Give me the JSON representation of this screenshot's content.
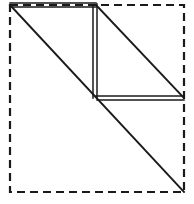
{
  "figure": {
    "canvas": {
      "width": 194,
      "height": 204
    },
    "background_color": "#ffffff",
    "line_color": "#1a1a1a",
    "boundary": {
      "name": "dashed-square-boundary",
      "style": "dashed",
      "x1": 10,
      "y1": 5,
      "x2": 184,
      "y2": 192,
      "dash_length": 8,
      "gap_length": 5,
      "stroke_width": 2.2
    },
    "lines": [
      {
        "name": "main-diagonal",
        "style": "solid",
        "stroke_width": 1.9,
        "points": [
          [
            10,
            5
          ],
          [
            184,
            192
          ]
        ]
      },
      {
        "name": "top-edge-outer",
        "style": "solid",
        "stroke_width": 1.5,
        "points": [
          [
            10,
            3
          ],
          [
            96,
            3
          ]
        ]
      },
      {
        "name": "top-edge-inner",
        "style": "solid",
        "stroke_width": 1.5,
        "points": [
          [
            11,
            7
          ],
          [
            96,
            7
          ]
        ]
      },
      {
        "name": "vertical-edge-left",
        "style": "solid",
        "stroke_width": 1.5,
        "points": [
          [
            93,
            6
          ],
          [
            93,
            98
          ]
        ]
      },
      {
        "name": "vertical-edge-right",
        "style": "solid",
        "stroke_width": 1.5,
        "points": [
          [
            97,
            4
          ],
          [
            97,
            98
          ]
        ]
      },
      {
        "name": "upper-right-diagonal",
        "style": "solid",
        "stroke_width": 1.9,
        "points": [
          [
            96,
            5
          ],
          [
            183,
            97
          ]
        ]
      },
      {
        "name": "horizontal-mid-edge-upper",
        "style": "solid",
        "stroke_width": 1.5,
        "points": [
          [
            96,
            96
          ],
          [
            184,
            96
          ]
        ]
      },
      {
        "name": "horizontal-mid-edge-lower",
        "style": "solid",
        "stroke_width": 1.5,
        "points": [
          [
            97,
            100
          ],
          [
            184,
            100
          ]
        ]
      }
    ],
    "vertices": [
      {
        "name": "vertex-top-left",
        "x": 10,
        "y": 5
      },
      {
        "name": "vertex-top-junction",
        "x": 96,
        "y": 5
      },
      {
        "name": "vertex-center-junction",
        "x": 97,
        "y": 98
      },
      {
        "name": "vertex-right-junction",
        "x": 184,
        "y": 98
      },
      {
        "name": "vertex-bottom-right",
        "x": 184,
        "y": 192
      },
      {
        "name": "vertex-top-right",
        "x": 184,
        "y": 5
      },
      {
        "name": "vertex-bottom-left",
        "x": 10,
        "y": 192
      }
    ]
  }
}
